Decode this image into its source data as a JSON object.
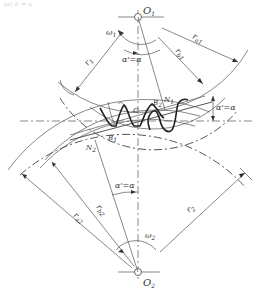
{
  "diagram": {
    "header_fragment": "(a)   a' = a",
    "colors": {
      "line": "#555555",
      "tooth": "#222222",
      "background": "#ffffff",
      "text": "#333333"
    },
    "labels": {
      "o1": "O",
      "o1_sub": "1",
      "o2": "O",
      "o2_sub": "2",
      "omega1": "ω",
      "omega1_sub": "1",
      "omega2": "ω",
      "omega2_sub": "2",
      "r1": "r",
      "r1_sub": "1",
      "rb1": "r",
      "rb1_sub": "b1",
      "ra1": "r",
      "ra1_sub": "a1",
      "r2": "r",
      "r2_sub": "2",
      "rb2": "r",
      "rb2_sub": "b2",
      "ra2": "r",
      "ra2_sub": "a2",
      "alpha_top": "α'=α",
      "alpha_right": "α'=α",
      "alpha_bottom": "α'=α",
      "n1": "N",
      "n1_sub": "1",
      "n2": "N",
      "n2_sub": "2",
      "b1": "B",
      "b1_sub": "1",
      "b2": "B",
      "b2_sub": "2",
      "c": "C"
    }
  }
}
